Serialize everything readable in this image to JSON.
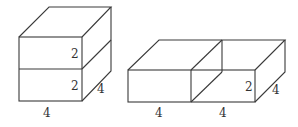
{
  "figures": [
    {
      "id": "stacked-prisms",
      "description": "Two 4x4x2 prisms stacked vertically forming a 4x4x4 cube",
      "labels": {
        "top_height": "2",
        "bottom_height": "2",
        "depth": "4",
        "width": "4"
      }
    },
    {
      "id": "side-by-side-prisms",
      "description": "Two 4x4x2 prisms placed side by side forming an 8x4x2 prism",
      "labels": {
        "height": "2",
        "depth": "4",
        "width_left": "4",
        "width_right": "4"
      }
    }
  ],
  "colors": {
    "line": "#3a3a3a",
    "text": "#333333",
    "background": "#ffffff"
  }
}
